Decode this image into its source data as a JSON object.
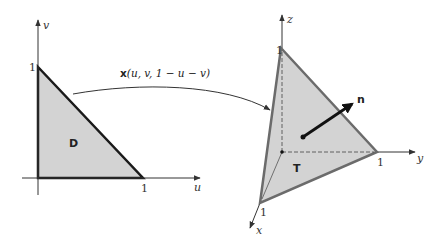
{
  "figure": {
    "left_diagram": {
      "region_label": "D",
      "axes": {
        "horizontal": "u",
        "vertical": "v"
      },
      "tick_labels": {
        "u_one": "1",
        "v_one": "1"
      },
      "vertices": [
        [
          0,
          0
        ],
        [
          1,
          0
        ],
        [
          0,
          1
        ]
      ]
    },
    "mapping": {
      "formula": "x(u, v) = (u, v, 1 − u − v)",
      "formula_bold": "x",
      "formula_rest": "(u, v, 1 − u − v)"
    },
    "right_diagram": {
      "surface_label": "T",
      "normal_label": "n",
      "axes": {
        "x": "x",
        "y": "y",
        "z": "z"
      },
      "tick_labels": {
        "x_one": "1",
        "y_one": "1",
        "z_one": "1"
      },
      "vertices": [
        [
          1,
          0,
          0
        ],
        [
          0,
          1,
          0
        ],
        [
          0,
          0,
          1
        ]
      ]
    },
    "colors": {
      "fill": "#d3d3d3",
      "left_edge": "#1a1a1a",
      "right_edge": "#6b6b6b",
      "axis": "#333333"
    }
  }
}
